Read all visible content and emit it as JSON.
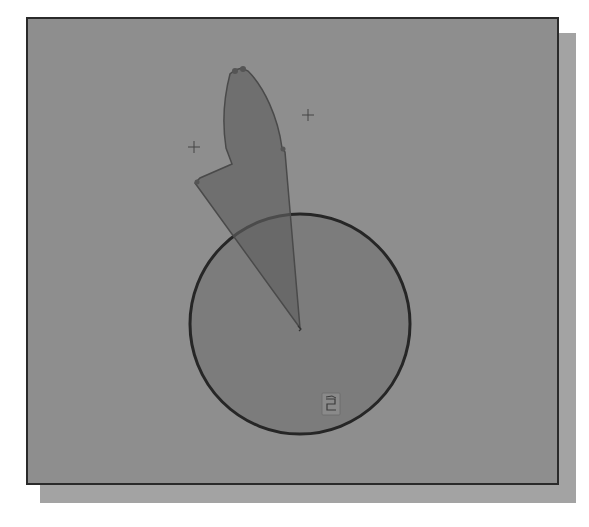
{
  "canvas": {
    "background_color": "#8e8e8e",
    "border_color": "#2a2a2a",
    "shadow_color": "#a3a3a3"
  },
  "sketch": {
    "circle": {
      "cx": 298,
      "cy": 322,
      "r": 110,
      "fill": "#7c7c7c",
      "stroke": "#262626"
    },
    "profile": {
      "fill": "#6e6e6e",
      "stroke": "#4a4a4a"
    },
    "construction_points": [
      {
        "name": "left-point",
        "x": 192,
        "y": 145
      },
      {
        "name": "right-point",
        "x": 306,
        "y": 114
      }
    ],
    "center_marker": {
      "x": 298,
      "y": 326
    },
    "view_icon": {
      "name": "view-orientation-icon",
      "x": 320,
      "y": 391
    }
  }
}
